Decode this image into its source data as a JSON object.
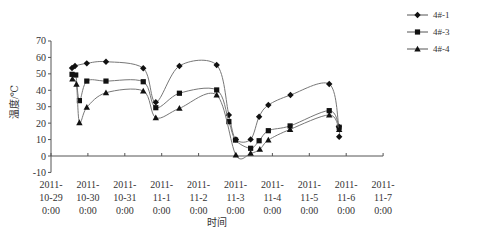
{
  "chart_data": {
    "type": "line",
    "title": "",
    "xlabel": "时间",
    "ylabel": "温度/℃",
    "ylim": [
      -10,
      70
    ],
    "yticks": [
      -10,
      0,
      10,
      20,
      30,
      40,
      50,
      60,
      70
    ],
    "xlim_days": [
      0,
      9
    ],
    "xtick_labels": [
      [
        "2011-",
        "10-29",
        "0:00"
      ],
      [
        "2011-",
        "10-30",
        "0:00"
      ],
      [
        "2011-",
        "10-31",
        "0:00"
      ],
      [
        "2011-",
        "11-1",
        "0:00"
      ],
      [
        "2011-",
        "11-2",
        "0:00"
      ],
      [
        "2011-",
        "11-3",
        "0:00"
      ],
      [
        "2011-",
        "11-4",
        "0:00"
      ],
      [
        "2011-",
        "11-5",
        "0:00"
      ],
      [
        "2011-",
        "11-6",
        "0:00"
      ],
      [
        "2011-",
        "11-7",
        "0:00"
      ]
    ],
    "grid": false,
    "legend_position": "top-right",
    "series": [
      {
        "name": "4#-1",
        "marker": "diamond",
        "points": [
          [
            0.57,
            53.6
          ],
          [
            0.65,
            54.8
          ],
          [
            0.97,
            56.4
          ],
          [
            1.49,
            57.4
          ],
          [
            2.5,
            53.4
          ],
          [
            2.84,
            32.7
          ],
          [
            3.48,
            54.8
          ],
          [
            4.49,
            55.4
          ],
          [
            4.82,
            25
          ],
          [
            5.01,
            10.1
          ],
          [
            5.41,
            10.1
          ],
          [
            5.64,
            23.9
          ],
          [
            5.89,
            31
          ],
          [
            6.49,
            37.1
          ],
          [
            7.54,
            43.8
          ],
          [
            7.8,
            17.8
          ],
          [
            7.81,
            11.7
          ]
        ]
      },
      {
        "name": "4#-3",
        "marker": "square",
        "points": [
          [
            0.57,
            49.7
          ],
          [
            0.67,
            49.3
          ],
          [
            0.77,
            33.7
          ],
          [
            0.97,
            45.6
          ],
          [
            1.49,
            45.6
          ],
          [
            2.5,
            45.2
          ],
          [
            2.84,
            29.4
          ],
          [
            3.48,
            38.2
          ],
          [
            4.49,
            40.2
          ],
          [
            4.82,
            20.9
          ],
          [
            5.0,
            9.7
          ],
          [
            5.41,
            4.7
          ],
          [
            5.64,
            9.3
          ],
          [
            5.89,
            15.4
          ],
          [
            6.48,
            18.3
          ],
          [
            7.54,
            27.6
          ],
          [
            7.81,
            17.5
          ]
        ]
      },
      {
        "name": "4#-4",
        "marker": "triangle",
        "points": [
          [
            0.58,
            46.9
          ],
          [
            0.69,
            43.6
          ],
          [
            0.77,
            20.3
          ],
          [
            0.97,
            29.6
          ],
          [
            1.49,
            38.5
          ],
          [
            2.5,
            39.6
          ],
          [
            2.84,
            23.3
          ],
          [
            3.48,
            29
          ],
          [
            4.49,
            37.1
          ],
          [
            5.01,
            0.6
          ],
          [
            5.41,
            1.6
          ],
          [
            5.66,
            4.1
          ],
          [
            5.89,
            9.7
          ],
          [
            6.48,
            16.2
          ],
          [
            7.54,
            25
          ],
          [
            7.81,
            16.2
          ]
        ]
      }
    ]
  }
}
